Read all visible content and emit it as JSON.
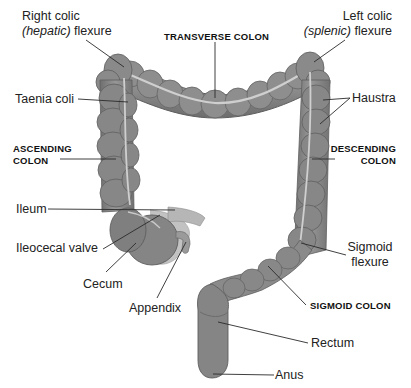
{
  "diagram": {
    "colors": {
      "organ_fill": "#8a8a8a",
      "organ_dark": "#6e6e6e",
      "organ_light": "#a9a9a9",
      "taenia": "#cfcfcf",
      "leader_line": "#2a2a2a",
      "background": "#ffffff"
    },
    "labels": {
      "right_colic_line1": "Right colic",
      "right_colic_italic": "(hepatic)",
      "right_colic_rest": " flexure",
      "transverse_colon": "TRANSVERSE COLON",
      "left_colic_line1": "Left colic",
      "left_colic_italic": "(splenic)",
      "left_colic_rest": " flexure",
      "taenia_coli": "Taenia coli",
      "haustra": "Haustra",
      "ascending_line1": "ASCENDING",
      "ascending_line2": "COLON",
      "descending_line1": "DESCENDING",
      "descending_line2": "COLON",
      "ileum": "Ileum",
      "ileocecal_valve": "Ileocecal valve",
      "cecum": "Cecum",
      "appendix": "Appendix",
      "sigmoid_flexure_line1": "Sigmoid",
      "sigmoid_flexure_line2": "flexure",
      "sigmoid_colon": "SIGMOID COLON",
      "rectum": "Rectum",
      "anus": "Anus"
    }
  }
}
